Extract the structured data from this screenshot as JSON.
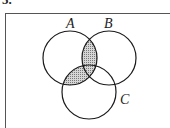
{
  "question": {
    "number": "5."
  },
  "diagram": {
    "type": "venn",
    "sets": [
      {
        "label": "A",
        "cx": 70,
        "cy": 58,
        "r": 27,
        "label_x": 66,
        "label_y": 28
      },
      {
        "label": "B",
        "cx": 109,
        "cy": 58,
        "r": 27,
        "label_x": 104,
        "label_y": 28
      },
      {
        "label": "C",
        "cx": 89,
        "cy": 92,
        "r": 27,
        "label_x": 120,
        "label_y": 104
      }
    ],
    "shaded_regions": [
      "A∩B",
      "A∩C"
    ],
    "shaded_expression": "A ∩ (B ∪ C)",
    "colors": {
      "stroke": "#1a1a1a",
      "shade": "#bdbdbd",
      "frame": "#555555"
    }
  }
}
